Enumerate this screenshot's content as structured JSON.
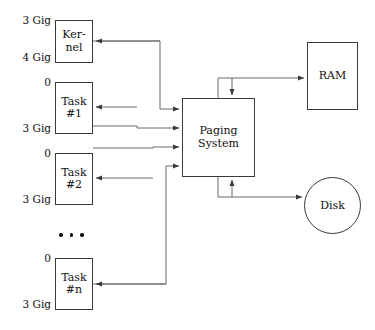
{
  "diagram": {
    "stroke_color": "#3a3a3a",
    "text_color": "#111111",
    "background": "#ffffff"
  },
  "nodes": {
    "kernel": {
      "label_line1": "Ker-",
      "label_line2": "nel",
      "top_label": "3 Gig",
      "bottom_label": "4 Gig"
    },
    "task1": {
      "label_line1": "Task",
      "label_line2": "#1",
      "top_label": "0",
      "bottom_label": "3 Gig"
    },
    "task2": {
      "label_line1": "Task",
      "label_line2": "#2",
      "top_label": "0",
      "bottom_label": "3 Gig"
    },
    "taskn": {
      "label_line1": "Task",
      "label_line2": "#n",
      "top_label": "0",
      "bottom_label": "3 Gig"
    },
    "paging_system": {
      "label_line1": "Paging",
      "label_line2": "System"
    },
    "ram": {
      "label": "RAM"
    },
    "disk": {
      "label": "Disk"
    }
  },
  "ellipsis": {
    "label": ". . .",
    "dot_count": 3
  },
  "connections": [
    {
      "from": "kernel",
      "to": "paging_system",
      "direction": "to-paging"
    },
    {
      "from": "task1",
      "to": "paging_system",
      "direction": "to-paging"
    },
    {
      "from": "task2",
      "to": "paging_system",
      "direction": "to-paging"
    },
    {
      "from": "taskn",
      "to": "paging_system",
      "direction": "to-paging"
    },
    {
      "from": "paging_system",
      "to": "kernel",
      "direction": "from-paging"
    },
    {
      "from": "paging_system",
      "to": "task1",
      "direction": "from-paging"
    },
    {
      "from": "paging_system",
      "to": "task2",
      "direction": "from-paging"
    },
    {
      "from": "paging_system",
      "to": "taskn",
      "direction": "from-paging"
    },
    {
      "from": "paging_system",
      "to": "ram",
      "direction": "bidirectional"
    },
    {
      "from": "paging_system",
      "to": "disk",
      "direction": "bidirectional"
    }
  ]
}
